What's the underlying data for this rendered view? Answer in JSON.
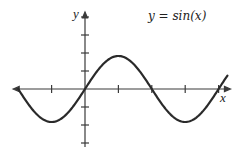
{
  "chart_data": {
    "type": "line",
    "title": "y = sin(x)",
    "xlabel": "x",
    "ylabel": "y",
    "function": "sin",
    "xlim": [
      -3.1416,
      6.7
    ],
    "ylim": [
      -3.2,
      4.0
    ],
    "x_ticks": [
      -1.5708,
      1.5708,
      3.1416,
      4.7124,
      6.2832
    ],
    "y_ticks": [
      -3,
      -2,
      -1,
      1,
      2,
      3
    ],
    "tick_labels_shown": false,
    "grid": false,
    "legend": "none",
    "series": [
      {
        "name": "sin(x)",
        "x": [
          -3.1416,
          -2.3562,
          -1.5708,
          -0.7854,
          0,
          0.7854,
          1.5708,
          2.3562,
          3.1416,
          3.927,
          4.7124,
          5.4978,
          6.2832,
          6.7
        ],
        "y": [
          0,
          -0.7071,
          -1,
          -0.7071,
          0,
          0.7071,
          1,
          0.7071,
          0,
          -0.7071,
          -1,
          -0.7071,
          0,
          0.407
        ]
      }
    ],
    "colors": {
      "curve": "#2a2a2a",
      "axis": "#3a3a3a",
      "text": "#222222"
    }
  },
  "layout": {
    "origin_px": [
      85,
      89
    ],
    "px_per_half_pi": 33.4,
    "px_per_y_tick": 18,
    "amplitude_px": 33
  }
}
